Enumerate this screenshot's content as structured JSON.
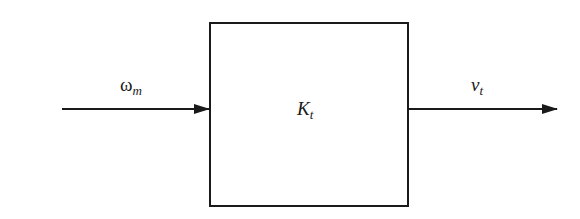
{
  "diagram": {
    "type": "block-diagram",
    "input": {
      "symbol": "ω",
      "subscript": "m"
    },
    "block": {
      "symbol": "K",
      "subscript": "t"
    },
    "output": {
      "symbol": "v",
      "subscript": "t"
    },
    "colors": {
      "stroke": "#1a1a1a",
      "background": "#ffffff"
    }
  }
}
